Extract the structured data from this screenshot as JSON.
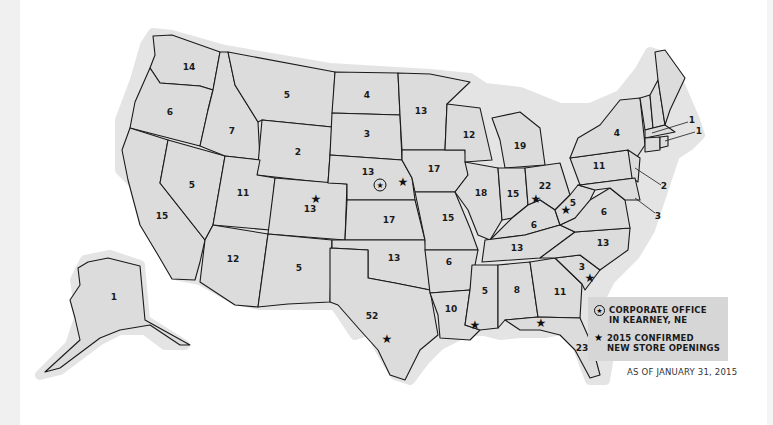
{
  "map": {
    "title": "Store locations by state",
    "background_color": "#ffffff",
    "state_fill": "#dcdcdc",
    "state_labels": [
      {
        "state": "WA",
        "count": "14",
        "x": 189,
        "y": 67
      },
      {
        "state": "OR",
        "count": "6",
        "x": 170,
        "y": 112
      },
      {
        "state": "CA",
        "count": "15",
        "x": 162,
        "y": 216
      },
      {
        "state": "NV",
        "count": "5",
        "x": 192,
        "y": 185
      },
      {
        "state": "ID",
        "count": "7",
        "x": 232,
        "y": 131
      },
      {
        "state": "MT",
        "count": "5",
        "x": 287,
        "y": 95
      },
      {
        "state": "WY",
        "count": "2",
        "x": 298,
        "y": 152
      },
      {
        "state": "UT",
        "count": "11",
        "x": 243,
        "y": 193
      },
      {
        "state": "CO",
        "count": "13",
        "x": 310,
        "y": 209
      },
      {
        "state": "AZ",
        "count": "12",
        "x": 233,
        "y": 259
      },
      {
        "state": "NM",
        "count": "5",
        "x": 299,
        "y": 268
      },
      {
        "state": "ND",
        "count": "4",
        "x": 367,
        "y": 95
      },
      {
        "state": "SD",
        "count": "3",
        "x": 367,
        "y": 134
      },
      {
        "state": "NE",
        "count": "13",
        "x": 368,
        "y": 172
      },
      {
        "state": "KS",
        "count": "17",
        "x": 389,
        "y": 220
      },
      {
        "state": "OK",
        "count": "13",
        "x": 394,
        "y": 258
      },
      {
        "state": "TX",
        "count": "52",
        "x": 372,
        "y": 316
      },
      {
        "state": "MN",
        "count": "13",
        "x": 421,
        "y": 111
      },
      {
        "state": "IA",
        "count": "17",
        "x": 434,
        "y": 169
      },
      {
        "state": "MO",
        "count": "15",
        "x": 448,
        "y": 218
      },
      {
        "state": "AR",
        "count": "6",
        "x": 449,
        "y": 262
      },
      {
        "state": "LA",
        "count": "10",
        "x": 451,
        "y": 309
      },
      {
        "state": "WI",
        "count": "12",
        "x": 469,
        "y": 135
      },
      {
        "state": "IL",
        "count": "18",
        "x": 481,
        "y": 193
      },
      {
        "state": "MI",
        "count": "19",
        "x": 520,
        "y": 146
      },
      {
        "state": "IN",
        "count": "15",
        "x": 513,
        "y": 194
      },
      {
        "state": "OH",
        "count": "22",
        "x": 545,
        "y": 186
      },
      {
        "state": "KY",
        "count": "6",
        "x": 534,
        "y": 225
      },
      {
        "state": "TN",
        "count": "13",
        "x": 517,
        "y": 248
      },
      {
        "state": "MS",
        "count": "5",
        "x": 485,
        "y": 291
      },
      {
        "state": "AL",
        "count": "8",
        "x": 517,
        "y": 290
      },
      {
        "state": "GA",
        "count": "11",
        "x": 560,
        "y": 292
      },
      {
        "state": "FL",
        "count": "23",
        "x": 582,
        "y": 348
      },
      {
        "state": "SC",
        "count": "3",
        "x": 582,
        "y": 267
      },
      {
        "state": "NC",
        "count": "13",
        "x": 603,
        "y": 243
      },
      {
        "state": "VA",
        "count": "6",
        "x": 604,
        "y": 212
      },
      {
        "state": "WV",
        "count": "5",
        "x": 573,
        "y": 203
      },
      {
        "state": "PA",
        "count": "11",
        "x": 599,
        "y": 166
      },
      {
        "state": "NY",
        "count": "4",
        "x": 617,
        "y": 133
      },
      {
        "state": "AK",
        "count": "1",
        "x": 114,
        "y": 297
      }
    ],
    "callout_labels": [
      {
        "state": "MA",
        "count": "1",
        "x": 692,
        "y": 120
      },
      {
        "state": "RI",
        "count": "1",
        "x": 699,
        "y": 131
      },
      {
        "state": "NJ",
        "count": "2",
        "x": 664,
        "y": 186
      },
      {
        "state": "MD",
        "count": "3",
        "x": 658,
        "y": 216
      }
    ],
    "new_store_stars": [
      {
        "state": "CO",
        "x": 316,
        "y": 199
      },
      {
        "state": "NE",
        "x": 403,
        "y": 182
      },
      {
        "state": "IN",
        "x": 536,
        "y": 199
      },
      {
        "state": "WV",
        "x": 566,
        "y": 210
      },
      {
        "state": "SC",
        "x": 590,
        "y": 278
      },
      {
        "state": "LA",
        "x": 475,
        "y": 325
      },
      {
        "state": "FL",
        "x": 541,
        "y": 323
      },
      {
        "state": "TX",
        "x": 387,
        "y": 339
      }
    ],
    "corporate_office": {
      "state": "NE",
      "x": 380,
      "y": 185
    }
  },
  "legend": {
    "corporate_office_label_line1": "CORPORATE OFFICE",
    "corporate_office_label_line2": "IN KEARNEY, NE",
    "new_stores_label_line1": "2015 CONFIRMED",
    "new_stores_label_line2": "NEW STORE OPENINGS",
    "as_of": "AS OF JANUARY 31, 2015"
  }
}
